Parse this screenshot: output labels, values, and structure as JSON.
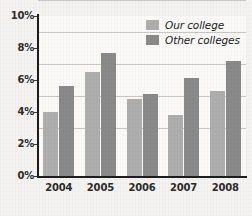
{
  "chart_data": {
    "type": "bar",
    "title": "",
    "subtitle": "",
    "xlabel": "",
    "ylabel": "",
    "categories": [
      "2004",
      "2005",
      "2006",
      "2007",
      "2008"
    ],
    "series": [
      {
        "name": "Our college",
        "values": [
          4.0,
          6.5,
          4.8,
          3.8,
          5.3
        ],
        "color": "#aeaeae"
      },
      {
        "name": "Other colleges",
        "values": [
          5.6,
          7.7,
          5.1,
          6.15,
          7.2
        ],
        "color": "#8a8a8a"
      }
    ],
    "ylim": [
      0,
      10
    ],
    "yticks": [
      0,
      2,
      4,
      6,
      8,
      10
    ],
    "ytick_labels": [
      "0%",
      "2%",
      "4%",
      "6%",
      "8%",
      "10%"
    ],
    "grid": true,
    "grid_axis": "y",
    "legend_position": "top-right",
    "value_unit": "%"
  },
  "legend": {
    "entries": [
      {
        "label": "Our college"
      },
      {
        "label": "Other colleges"
      }
    ]
  },
  "colors": {
    "series_0": "#aeaeae",
    "series_1": "#8a8a8a",
    "axis": "#1d1d1d",
    "gridline": "#c9c7c4",
    "text": "#2b2b2b",
    "background": "#f4f3f1",
    "plot_background": "#fbfaf8"
  }
}
